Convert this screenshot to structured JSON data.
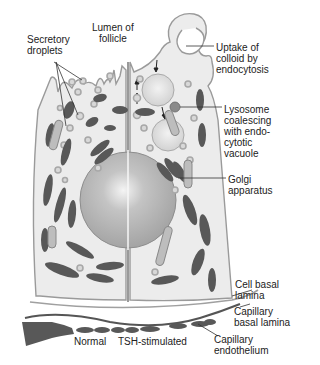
{
  "diagram": {
    "colors": {
      "background": "#ffffff",
      "cytoplasm": "#ececec",
      "outline": "#9a9a9a",
      "nucleus": "#b4b4b4",
      "mitochondria": "#555555",
      "droplet": "#c8c8c8",
      "label_text": "#222222"
    },
    "labels": {
      "secretory_droplets": "Secretory\ndroplets",
      "lumen": "Lumen of\nfollicle",
      "uptake": "Uptake of\ncolloid by\nendocytosis",
      "lysosome": "Lysosome\ncoalescing\nwith endo-\ncytotic\nvacuole",
      "golgi": "Golgi\napparatus",
      "cell_basal_lamina": "Cell basal\nlamina",
      "capillary_basal_lamina": "Capillary\nbasal lamina",
      "capillary_endothelium": "Capillary\nendothelium",
      "normal": "Normal",
      "tsh": "TSH-stimulated"
    }
  }
}
